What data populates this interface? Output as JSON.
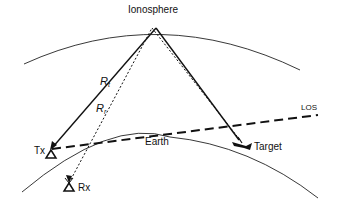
{
  "diagram": {
    "labels": {
      "ionosphere": "Ionosphere",
      "earth": "Earth",
      "los": "LOS",
      "tx": "Tx",
      "rx": "Rx",
      "target": "Target",
      "rt_main": "R",
      "rt_sub": "t",
      "rr_main": "R",
      "rr_sub": "r"
    },
    "colors": {
      "line": "#111111",
      "background": "#ffffff"
    }
  }
}
